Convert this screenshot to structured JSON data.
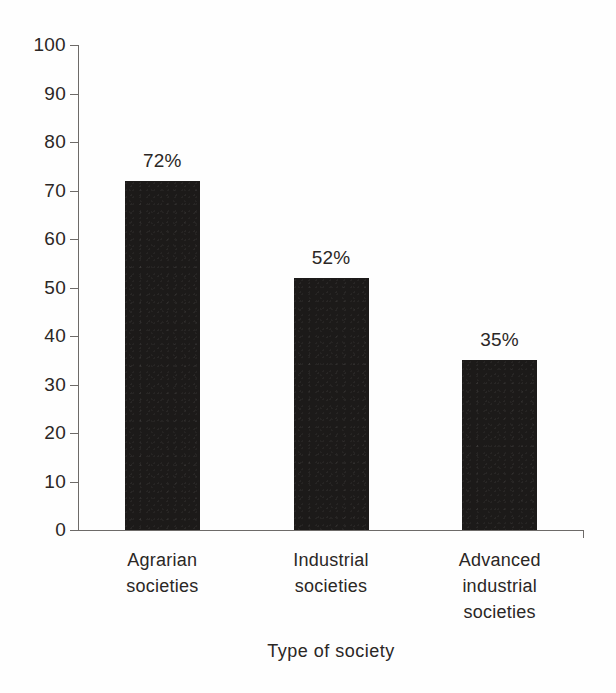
{
  "chart_data": {
    "type": "bar",
    "title": "",
    "xlabel": "Type of society",
    "ylabel": "",
    "ylim": [
      0,
      100
    ],
    "ytick_step": 10,
    "grid": false,
    "legend": false,
    "categories": [
      "Agrarian societies",
      "Industrial societies",
      "Advanced industrial societies"
    ],
    "category_lines": [
      [
        "Agrarian",
        "societies"
      ],
      [
        "Industrial",
        "societies"
      ],
      [
        "Advanced",
        "industrial",
        "societies"
      ]
    ],
    "values": [
      72,
      52,
      35
    ],
    "data_labels": [
      "72%",
      "52%",
      "35%"
    ],
    "ytick_labels": [
      "100",
      "90",
      "80",
      "70",
      "60",
      "50",
      "40",
      "30",
      "20",
      "10",
      "0"
    ],
    "ytick_values": [
      100,
      90,
      80,
      70,
      60,
      50,
      40,
      30,
      20,
      10,
      0
    ],
    "colors": {
      "bar": "#1c1a19",
      "axis": "#6d6a68",
      "text": "#2b2725",
      "background": "#fefefe"
    }
  }
}
